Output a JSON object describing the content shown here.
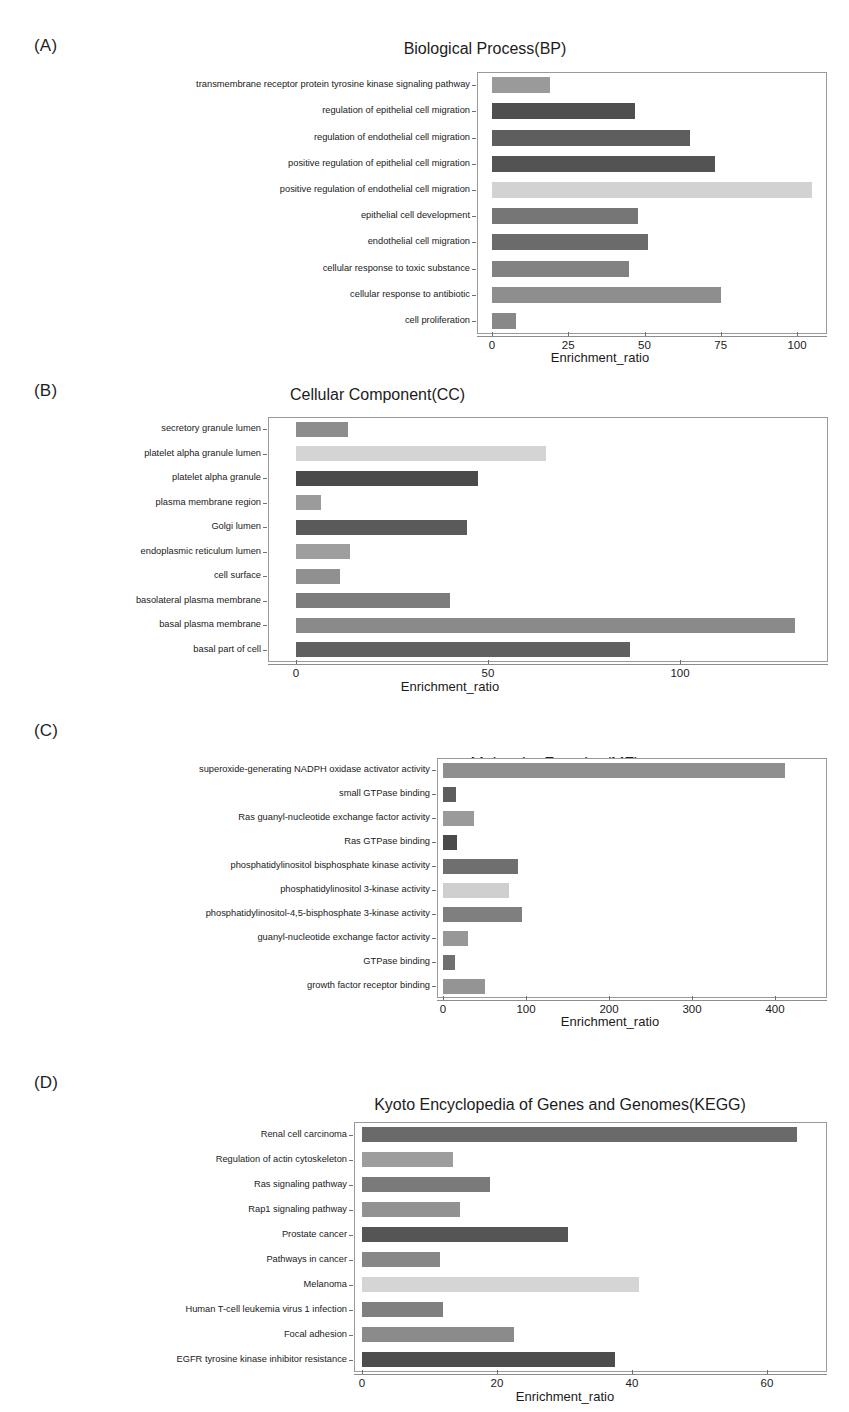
{
  "figure": {
    "xlabel": "Enrichment_ratio",
    "panels": [
      {
        "tag": "(A)",
        "title": "Biological Process(BP)"
      },
      {
        "tag": "(B)",
        "title": "Cellular Component(CC)"
      },
      {
        "tag": "(C)",
        "title": "Molecular Function(MF)"
      },
      {
        "tag": "(D)",
        "title": "Kyoto Encyclopedia of Genes and Genomes(KEGG)"
      }
    ]
  },
  "chart_data": [
    {
      "panel": "A",
      "type": "bar",
      "orientation": "horizontal",
      "title": "Biological Process(BP)",
      "xlabel": "Enrichment_ratio",
      "ylabel": "",
      "xlim": [
        0,
        112
      ],
      "xticks": [
        0,
        25,
        50,
        75,
        100
      ],
      "grid": false,
      "legend": "none",
      "categories": [
        "transmembrane receptor protein tyrosine kinase signaling pathway",
        "regulation of epithelial cell migration",
        "regulation of endothelial cell migration",
        "positive regulation of epithelial cell migration",
        "positive regulation of endothelial cell migration",
        "epithelial cell development",
        "endothelial cell migration",
        "cellular response to toxic substance",
        "cellular response to antibiotic",
        "cell proliferation"
      ],
      "values": [
        19,
        47,
        65,
        73,
        105,
        48,
        51,
        45,
        75,
        8
      ],
      "colors": [
        "#9a9a9a",
        "#4f4f4f",
        "#5e5e5e",
        "#535353",
        "#d2d2d2",
        "#767676",
        "#6b6b6b",
        "#828282",
        "#8e8e8e",
        "#888888"
      ]
    },
    {
      "panel": "B",
      "type": "bar",
      "orientation": "horizontal",
      "title": "Cellular Component(CC)",
      "xlabel": "Enrichment_ratio",
      "ylabel": "",
      "xlim": [
        0,
        138
      ],
      "xticks": [
        0,
        50,
        100
      ],
      "grid": false,
      "legend": "none",
      "categories": [
        "secretory granule lumen",
        "platelet alpha granule lumen",
        "platelet alpha granule",
        "plasma membrane region",
        "Golgi lumen",
        "endoplasmic reticulum lumen",
        "cell surface",
        "basolateral plasma membrane",
        "basal plasma membrane",
        "basal part of cell"
      ],
      "values": [
        13.5,
        65,
        47.5,
        6.5,
        44.5,
        14,
        11.5,
        40,
        130,
        87
      ],
      "colors": [
        "#8d8d8d",
        "#d4d4d4",
        "#4b4b4b",
        "#9b9b9b",
        "#5a5a5a",
        "#9e9e9e",
        "#909090",
        "#7c7c7c",
        "#8a8a8a",
        "#606060"
      ]
    },
    {
      "panel": "C",
      "type": "bar",
      "orientation": "horizontal",
      "title": "Molecular Function(MF)",
      "xlabel": "Enrichment_ratio",
      "ylabel": "",
      "xlim": [
        0,
        440
      ],
      "xticks": [
        0,
        100,
        200,
        300,
        400
      ],
      "grid": false,
      "legend": "none",
      "categories": [
        "superoxide-generating NADPH oxidase activator activity",
        "small GTPase binding",
        "Ras guanyl-nucleotide exchange factor activity",
        "Ras GTPase binding",
        "phosphatidylinositol bisphosphate kinase activity",
        "phosphatidylinositol 3-kinase activity",
        "phosphatidylinositol-4,5-bisphosphate 3-kinase activity",
        "guanyl-nucleotide exchange factor activity",
        "GTPase binding",
        "growth factor receptor binding"
      ],
      "values": [
        412,
        16,
        37,
        17,
        90,
        80,
        95,
        30,
        15,
        50
      ],
      "colors": [
        "#8f8f8f",
        "#5d5d5d",
        "#9a9a9a",
        "#4a4a4a",
        "#6f6f6f",
        "#cfcfcf",
        "#7f7f7f",
        "#979797",
        "#707070",
        "#949494"
      ]
    },
    {
      "panel": "D",
      "type": "bar",
      "orientation": "horizontal",
      "title": "Kyoto Encyclopedia of Genes and Genomes(KEGG)",
      "xlabel": "Enrichment_ratio",
      "ylabel": "",
      "xlim": [
        0,
        68
      ],
      "xticks": [
        0,
        20,
        40,
        60
      ],
      "grid": false,
      "legend": "none",
      "categories": [
        "Renal cell carcinoma",
        "Regulation of actin cytoskeleton",
        "Ras signaling pathway",
        "Rap1 signaling pathway",
        "Prostate cancer",
        "Pathways in cancer",
        "Melanoma",
        "Human T-cell leukemia virus 1 infection",
        "Focal adhesion",
        "EGFR tyrosine kinase inhibitor resistance"
      ],
      "values": [
        64.5,
        13.5,
        19,
        14.5,
        30.5,
        11.5,
        41,
        12,
        22.5,
        37.5
      ],
      "colors": [
        "#6a6a6a",
        "#9d9d9d",
        "#7a7a7a",
        "#929292",
        "#555555",
        "#878787",
        "#d5d5d5",
        "#808080",
        "#8b8b8b",
        "#4d4d4d"
      ]
    }
  ]
}
